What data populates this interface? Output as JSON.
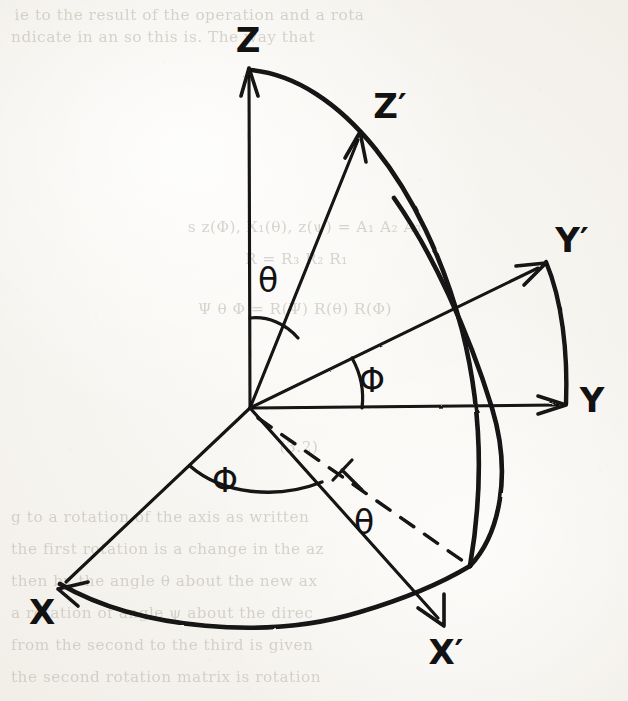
{
  "page": {
    "width": 628,
    "height": 701,
    "background_color": "#f2efe9",
    "ink_color": "#121212",
    "bleed_text_color": "#b9b4ab"
  },
  "diagram": {
    "origin": {
      "x": 250,
      "y": 408
    },
    "axes": [
      {
        "id": "z",
        "label": "Z",
        "label_x": 248,
        "label_y": 52,
        "tip_x": 248,
        "tip_y": 70,
        "style": "solid",
        "arrow": true
      },
      {
        "id": "z-prime",
        "label": "Z′",
        "label_x": 390,
        "label_y": 118,
        "tip_x": 360,
        "tip_y": 133,
        "style": "solid",
        "arrow": true
      },
      {
        "id": "y",
        "label": "Y",
        "label_x": 592,
        "label_y": 412,
        "tip_x": 566,
        "tip_y": 405,
        "style": "solid",
        "arrow": true
      },
      {
        "id": "y-prime",
        "label": "Y′",
        "label_x": 572,
        "label_y": 252,
        "tip_x": 546,
        "tip_y": 263,
        "style": "solid",
        "arrow": true
      },
      {
        "id": "x",
        "label": "X",
        "label_x": 42,
        "label_y": 624,
        "tip_x": 58,
        "tip_y": 589,
        "style": "solid",
        "arrow": true
      },
      {
        "id": "x-prime",
        "label": "X′",
        "label_x": 446,
        "label_y": 664,
        "tip_x": 444,
        "tip_y": 626,
        "style": "solid",
        "arrow": true
      }
    ],
    "dashed_line": {
      "id": "projection-line",
      "from_x": 256,
      "from_y": 416,
      "to_x": 470,
      "to_y": 566,
      "has_right_angle_tick": true
    },
    "angle_marks": [
      {
        "id": "theta-upper",
        "symbol": "θ",
        "label_x": 268,
        "label_y": 292,
        "between": [
          "Z",
          "Z′"
        ]
      },
      {
        "id": "phi-upper",
        "symbol": "Φ",
        "label_x": 372,
        "label_y": 392,
        "between": [
          "Y",
          "Y′"
        ]
      },
      {
        "id": "phi-lower",
        "symbol": "Φ",
        "label_x": 225,
        "label_y": 492,
        "between": [
          "X",
          "X′"
        ]
      },
      {
        "id": "theta-lower",
        "symbol": "θ",
        "label_x": 364,
        "label_y": 534,
        "between": [
          "X′",
          "projection-line"
        ]
      }
    ],
    "arcs": [
      {
        "id": "arc-z-to-xprime",
        "description": "great circle arc from Z through Z-prime down to X-prime"
      },
      {
        "id": "arc-yprime-sphere",
        "description": "great circle arc through Y-prime crossing Y axis down to X-prime"
      },
      {
        "id": "arc-x-to-xprime",
        "description": "arc in the XY plane from X across to X-prime"
      }
    ]
  },
  "bleed_through": {
    "note": "Faint show-through of printed text from the reverse side of the scanned page",
    "lines": [
      {
        "text": "ie  to  the   result  of  the   operation  and  a  rota",
        "x": 18,
        "y": 6,
        "size": 15
      },
      {
        "text": "ndicate   in  an  so  this   is.   The   way   that",
        "x": 14,
        "y": 28,
        "size": 15
      },
      {
        "text": "s  z(Φ),  X₁(θ),  z(ψ)   =   A₁ A₂ A₃",
        "x": 190,
        "y": 218,
        "size": 15
      },
      {
        "text": "R  =  R₃ R₂ R₁",
        "x": 246,
        "y": 250,
        "size": 15
      },
      {
        "text": "Ψ θ Φ  =  R(Ψ) R(θ) R(Φ)",
        "x": 200,
        "y": 300,
        "size": 15
      },
      {
        "text": "(3.2)",
        "x": 280,
        "y": 438,
        "size": 15
      },
      {
        "text": "g  to  a  rotation  of  the  axis  as  written",
        "x": 14,
        "y": 508,
        "size": 15
      },
      {
        "text": "the  first  rotation  is  a  change  in   the   az",
        "x": 14,
        "y": 540,
        "size": 15
      },
      {
        "text": "then  by  the  angle  θ  about  the  new  ax",
        "x": 14,
        "y": 572,
        "size": 15
      },
      {
        "text": "a  rotation  of  angle  ψ  about  the  direc",
        "x": 14,
        "y": 604,
        "size": 15
      },
      {
        "text": "from  the  second  to  the  third  is  given",
        "x": 14,
        "y": 636,
        "size": 15
      },
      {
        "text": "the  second   rotation   matrix   is  rotation",
        "x": 14,
        "y": 668,
        "size": 15
      }
    ]
  }
}
